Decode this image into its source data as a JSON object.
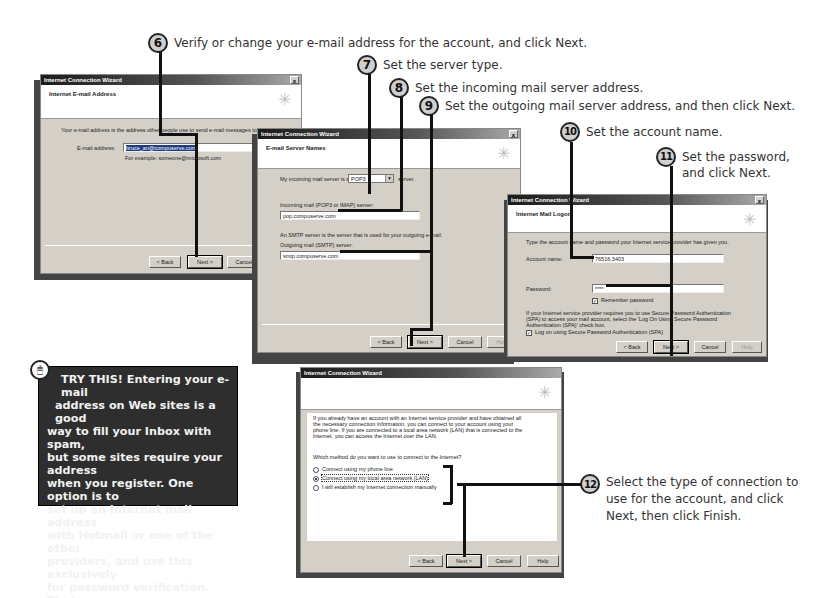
{
  "callouts": [
    {
      "num": "6",
      "text": "Verify or change your e-mail address for the account, and click Next."
    },
    {
      "num": "7",
      "text": "Set the server type."
    },
    {
      "num": "8",
      "text": "Set the incoming mail server address."
    },
    {
      "num": "9",
      "text": "Set the outgoing mail server address, and then click Next."
    },
    {
      "num": "10",
      "text": "Set the account name."
    },
    {
      "num": "11",
      "text_line1": "Set the password,",
      "text_line2": "and click Next."
    },
    {
      "num": "12",
      "text_line1": "Select the type of connection to",
      "text_line2": "use for the account, and click",
      "text_line3": "Next, then click Finish."
    }
  ],
  "dialogs": {
    "email_address": {
      "title": "Internet Connection Wizard",
      "close": "x",
      "header": "Internet E-mail Address",
      "description": "Your e-mail address is the address other people use to send e-mail messages to you.",
      "email_label": "E-mail address:",
      "email_value": "bruce_an@compuserve.com",
      "example": "For example: someone@microsoft.com",
      "buttons": {
        "back": "< Back",
        "next": "Next >",
        "cancel": "Cancel"
      }
    },
    "server_names": {
      "title": "Internet Connection Wizard",
      "close": "x",
      "header": "E-mail Server Names",
      "server_type_prefix": "My incoming mail server is a",
      "server_type_value": "POP3",
      "server_type_suffix": "server.",
      "incoming_label": "Incoming mail (POP3 or IMAP) server:",
      "incoming_value": "pop.compuserve.com",
      "smtp_note": "An SMTP server is the server that is used for your outgoing e-mail.",
      "outgoing_label": "Outgoing mail (SMTP) server:",
      "outgoing_value": "smtp.compuserve.com",
      "buttons": {
        "back": "< Back",
        "next": "Next >",
        "cancel": "Cancel",
        "help": "Help"
      }
    },
    "mail_logon": {
      "title": "Internet Connection Wizard",
      "close": "x",
      "header": "Internet Mail Logon",
      "description": "Type the account name and password your Internet service provider has given you.",
      "account_label": "Account name:",
      "account_value": "76516,3403",
      "password_label": "Password:",
      "password_value": "****",
      "remember_label": "Remember password",
      "spa_note_1": "If your Internet service provider requires you to use Secure Password Authentication",
      "spa_note_2": "(SPA) to access your mail account, select the 'Log On Using Secure Password",
      "spa_note_3": "Authentication (SPA)' check box.",
      "spa_label": "Log on using Secure Password Authentication (SPA)",
      "buttons": {
        "back": "< Back",
        "next": "Next >",
        "cancel": "Cancel",
        "help": "Help"
      }
    },
    "connection_type": {
      "title": "Internet Connection Wizard",
      "intro_1": "If you already have an account with an Internet service provider and have obtained all",
      "intro_2": "the necessary connection information, you can connect to your account using your",
      "intro_3": "phone line. If you are connected to a local area network (LAN) that is connected to the",
      "intro_4": "Internet, you can access the Internet over the LAN.",
      "question": "Which method do you want to use to connect to the Internet?",
      "options": [
        {
          "label": "Connect using my phone line",
          "selected": false
        },
        {
          "label": "Connect using my local area network (LAN)",
          "selected": true
        },
        {
          "label": "I will establish my Internet connection manually",
          "selected": false
        }
      ],
      "buttons": {
        "back": "< Back",
        "next": "Next >",
        "cancel": "Cancel",
        "help": "Help"
      }
    }
  },
  "try_this": {
    "heading": "TRY THIS!",
    "body_lead": "Entering your e-mail",
    "line2": "address on Web sites is a good",
    "line3": "way to fill your Inbox with spam,",
    "line4": "but some sites require your address",
    "line5": "when you register. One option is to",
    "line6": "set up an Internet mail address",
    "line7": "with Hotmail or one of the other",
    "line8": "providers, and use this exclusively",
    "line9": "for password verification. That way",
    "line10": "the unsolicited e-mail will go to an",
    "line11": "address that you'll check only",
    "line12": "occasionally."
  }
}
